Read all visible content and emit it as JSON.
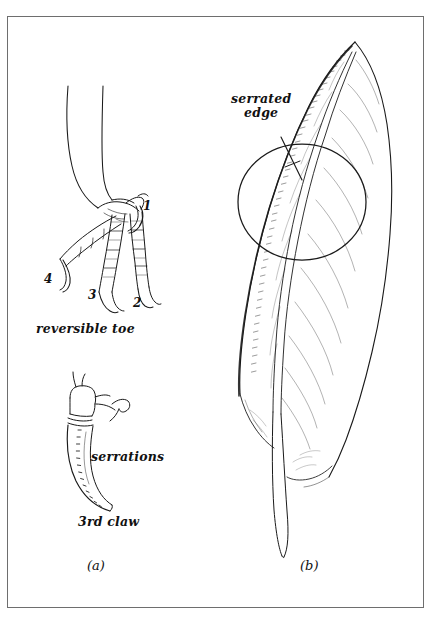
{
  "figure": {
    "kind": "scientific-line-drawing",
    "background_color": "#ffffff",
    "ink_color": "#1a1a1a",
    "frame_color": "#6e6e6e",
    "panels": [
      {
        "id": "a",
        "caption": "(a)",
        "subject": "bird foot with reversible toe and 3rd claw detail",
        "labels": [
          {
            "name": "reversible-toe",
            "text": "reversible toe"
          },
          {
            "name": "serrations",
            "text": "serrations"
          },
          {
            "name": "third-claw",
            "text": "3rd claw"
          }
        ],
        "toe_numbers": [
          "1",
          "2",
          "3",
          "4"
        ]
      },
      {
        "id": "b",
        "caption": "(b)",
        "subject": "feather with magnified serrated leading edge",
        "labels": [
          {
            "name": "serrated-edge",
            "line1": "serrated",
            "line2": "edge"
          }
        ]
      }
    ],
    "captions": {
      "a": "(a)",
      "b": "(b)"
    },
    "labels": {
      "reversible_toe": "reversible toe",
      "serrations": "serrations",
      "third_claw": "3rd claw",
      "serrated_edge_line1": "serrated",
      "serrated_edge_line2": "edge"
    },
    "toe_numbers": {
      "one": "1",
      "two": "2",
      "three": "3",
      "four": "4"
    }
  }
}
